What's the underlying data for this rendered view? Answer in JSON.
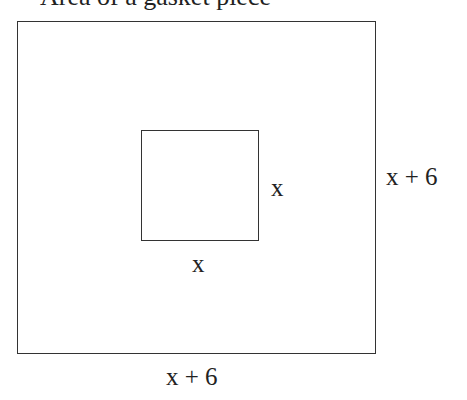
{
  "diagram": {
    "title_clipped": "Area of a gasket piece",
    "outer_square": {
      "side_label_right": "x + 6",
      "side_label_bottom": "x + 6"
    },
    "inner_square": {
      "side_label_right": "x",
      "side_label_bottom": "x"
    },
    "colors": {
      "stroke": "#333333",
      "text": "#222222",
      "background": "#ffffff"
    }
  }
}
